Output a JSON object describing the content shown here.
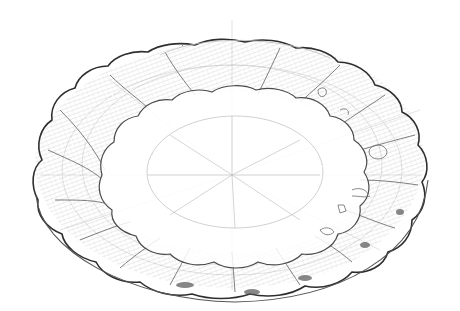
{
  "image": {
    "subject": "Pencil sketch of a scalloped (fluted) shallow bowl seen from above at an angle",
    "medium": "graphite pencil on white paper",
    "colors": {
      "paper": "#ffffff",
      "line_dark": "#2a2a2a",
      "line_mid": "#6b6b6b",
      "line_light": "#bdbdbd",
      "shade": "#9a9a9a"
    },
    "bowl": {
      "center": [
        232,
        175
      ],
      "outer_rim": {
        "cx": 232,
        "cy": 155,
        "rx": 200,
        "ry": 128
      },
      "inner_rim": {
        "cx": 232,
        "cy": 172,
        "rx": 130,
        "ry": 80
      },
      "well": {
        "cx": 235,
        "cy": 170,
        "rx": 85,
        "ry": 55
      },
      "lobes": 16
    }
  }
}
